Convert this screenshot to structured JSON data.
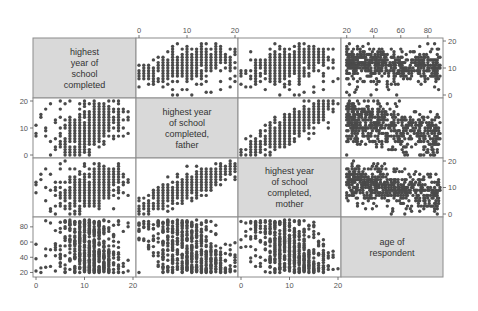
{
  "chart_data": {
    "type": "scatter",
    "subtype": "scatterplot-matrix",
    "variables": [
      {
        "key": "educ",
        "label_lines": [
          "highest",
          "year of",
          "school",
          "completed"
        ],
        "range": [
          0,
          20
        ],
        "ticks": [
          0,
          10,
          20
        ]
      },
      {
        "key": "paeduc",
        "label_lines": [
          "highest year",
          "of school",
          "completed,",
          "father"
        ],
        "range": [
          0,
          20
        ],
        "ticks": [
          0,
          10,
          20
        ]
      },
      {
        "key": "maeduc",
        "label_lines": [
          "highest year",
          "of school",
          "completed,",
          "mother"
        ],
        "range": [
          0,
          20
        ],
        "ticks": [
          0,
          10,
          20
        ]
      },
      {
        "key": "age",
        "label_lines": [
          "age of",
          "respondent"
        ],
        "range": [
          18,
          89
        ],
        "ticks": [
          20,
          40,
          60,
          80
        ]
      }
    ],
    "axes": {
      "top": [
        {
          "column": 1,
          "ticks": [
            0,
            10,
            20
          ]
        },
        {
          "column": 3,
          "ticks": [
            20,
            40,
            60,
            80
          ]
        }
      ],
      "bottom": [
        {
          "column": 0,
          "ticks": [
            0,
            10,
            20
          ]
        },
        {
          "column": 2,
          "ticks": [
            0,
            10,
            20
          ]
        }
      ],
      "left": [
        {
          "row": 1,
          "ticks": [
            0,
            10,
            20
          ]
        },
        {
          "row": 3,
          "ticks": [
            20,
            40,
            60,
            80
          ]
        }
      ],
      "right": [
        {
          "row": 0,
          "ticks": [
            0,
            10,
            20
          ]
        },
        {
          "row": 2,
          "ticks": [
            0,
            10,
            20
          ]
        }
      ]
    },
    "panel_patterns": {
      "educ_vs_paeduc": "positive association; father's education spread 0-20, respondent education concentrated 8-20",
      "educ_vs_maeduc": "positive association; similar to father",
      "educ_vs_age": "respondent education 8-20 across all ages 20-89, lower education at older ages",
      "paeduc_vs_maeduc": "strong positive association",
      "paeduc_vs_age": "parental education decreases with respondent age",
      "maeduc_vs_age": "parental education decreases with respondent age"
    },
    "grid": false,
    "legend": false,
    "title": ""
  },
  "style": {
    "label_cell_fill": "#d9d9d9",
    "panel_border": "#8c8c8c",
    "dot_color": "#4a4a4a",
    "tick_color": "#555555"
  }
}
